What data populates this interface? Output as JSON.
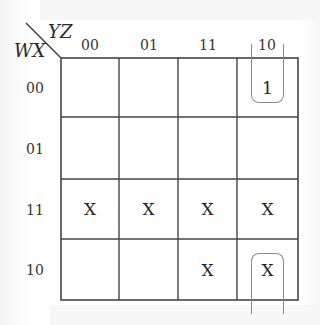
{
  "kmap": {
    "row_variable": "WX",
    "col_variable": "YZ",
    "col_labels": [
      "00",
      "01",
      "11",
      "10"
    ],
    "row_labels": [
      "00",
      "01",
      "11",
      "10"
    ],
    "cells": [
      [
        "",
        "",
        "",
        "1"
      ],
      [
        "",
        "",
        "",
        ""
      ],
      [
        "X",
        "X",
        "X",
        "X"
      ],
      [
        "",
        "",
        "X",
        "X"
      ]
    ],
    "groupings": [
      {
        "description": "wrap-around group in column 10 covering rows 00 and 10",
        "cells": [
          [
            0,
            3
          ],
          [
            3,
            3
          ]
        ],
        "color": "#8a8a8a"
      }
    ],
    "grid_color": "#444444"
  }
}
